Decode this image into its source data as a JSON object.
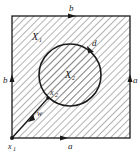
{
  "figure": {
    "regions": {
      "outer": "X",
      "outer_sub": "1",
      "inner": "X",
      "inner_sub": "2"
    },
    "edges": {
      "top": "b",
      "left": "b",
      "right": "a",
      "bottom": "a"
    },
    "circle_label": "d",
    "path_label": "w",
    "points": {
      "corner": "x",
      "corner_sub": "1",
      "circle_point": "x",
      "circle_point_sub": "2"
    },
    "colors": {
      "stroke": "#1a1a1a",
      "hatch": "#555555",
      "background": "#ffffff"
    }
  }
}
